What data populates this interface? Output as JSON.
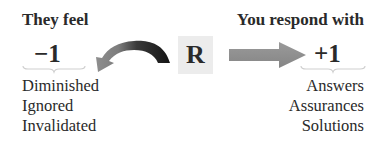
{
  "left": {
    "heading": "They feel",
    "value": "−1",
    "items": [
      "Diminished",
      "Ignored",
      "Invalidated"
    ]
  },
  "center": {
    "label": "R",
    "box_color": "#ececec"
  },
  "right": {
    "heading": "You respond with",
    "value": "+1",
    "items": [
      "Answers",
      "Assurances",
      "Solutions"
    ]
  },
  "arrows": {
    "curved": {
      "icon": "curved-back-arrow-icon",
      "dark_color": "#1e1e1e",
      "light_color": "#8a8a8a"
    },
    "straight": {
      "icon": "right-arrow-icon",
      "color": "#8c8c8c"
    }
  }
}
